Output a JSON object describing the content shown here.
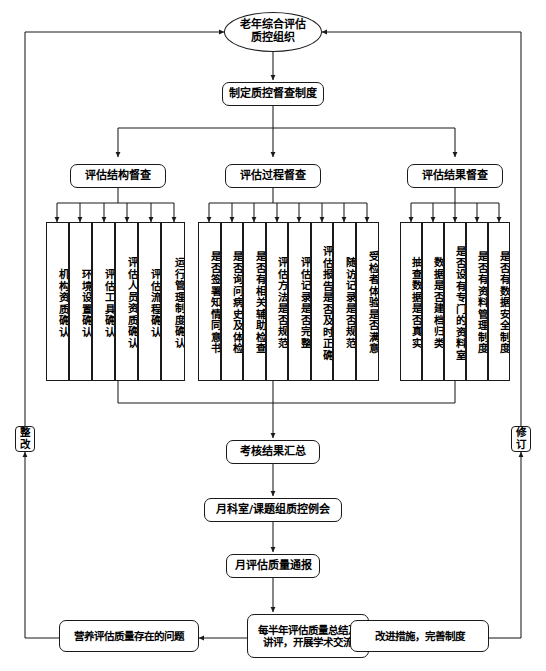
{
  "diagram": {
    "colors": {
      "line": "#1a1a1a",
      "fill": "#ffffff",
      "text": "#000000"
    }
  },
  "top": {
    "root": "老年综合评估\n质控组织",
    "root_line1": "老年综合评估",
    "root_line2": "质控组织",
    "policy": "制定质控督查制度"
  },
  "branches": [
    {
      "header": "评估结构督查",
      "items": [
        "机构资质确认",
        "环境设置确认",
        "评估工具确认",
        "评估人员资质确认",
        "评估流程确认",
        "运行管理制度确认"
      ]
    },
    {
      "header": "评估过程督查",
      "items": [
        "是否签署知情同意书",
        "是否询问病史及体检",
        "是否有相关辅助检查",
        "评估方法是否规范",
        "评估记录是否完整",
        "评估报告是否及时正确",
        "随访记录是否规范",
        "受检者体验是否满意"
      ]
    },
    {
      "header": "评估结果督查",
      "items": [
        "抽查数据是否真实",
        "数据是否建档归类",
        "是否设有专门的资料室",
        "是否有资料管理制度",
        "是否有数据安全制度"
      ]
    }
  ],
  "flow": {
    "summary": "考核结果汇总",
    "meeting": "月科室/课题组质控例会",
    "report": "月评估质量通报",
    "review_line1": "每半年评估质量总结及",
    "review_line2": "讲评，开展学术交流",
    "problems": "营养评估质量存在的问题",
    "improve": "改进措施，完善制度"
  },
  "side": {
    "left_label": "整改",
    "right_label": "修订"
  }
}
